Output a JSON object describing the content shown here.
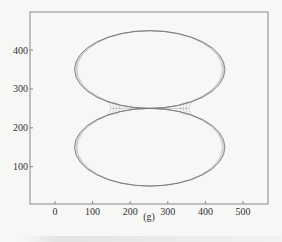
{
  "chart_data": {
    "type": "line",
    "title": "",
    "caption": "(g)",
    "xlabel": "",
    "ylabel": "",
    "xlim": [
      -65,
      570
    ],
    "ylim": [
      0,
      480
    ],
    "xticks": [
      0,
      100,
      200,
      300,
      400,
      500
    ],
    "yticks": [
      100,
      200,
      300,
      400
    ],
    "grid": false,
    "legend": null,
    "series": [
      {
        "name": "upper-lobe",
        "shape": "ellipse",
        "cx": 252,
        "cy": 350,
        "rx": 200,
        "ry": 100
      },
      {
        "name": "lower-lobe",
        "shape": "ellipse",
        "cx": 252,
        "cy": 150,
        "rx": 200,
        "ry": 100
      }
    ],
    "trace_offsets": [
      0,
      3,
      6,
      9,
      12
    ],
    "line_color": "#7a7a7a"
  }
}
